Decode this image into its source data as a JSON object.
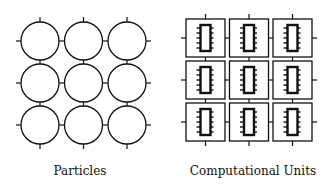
{
  "diagram": {
    "left_panel": {
      "label": "Particles",
      "rows": 3,
      "cols": 3,
      "element": "circle-particle"
    },
    "right_panel": {
      "label": "Computational Units",
      "rows": 3,
      "cols": 3,
      "element": "boxed-chip-unit"
    },
    "colors": {
      "stroke": "#111111",
      "background": "#ffffff"
    }
  }
}
